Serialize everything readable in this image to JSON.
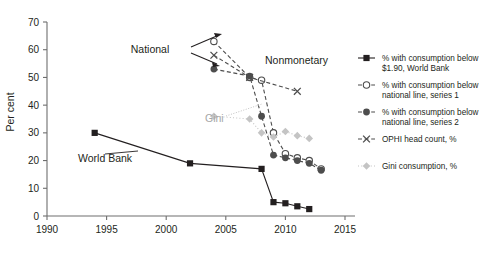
{
  "chart_data": {
    "type": "line",
    "title": "",
    "xlabel": "",
    "ylabel": "Per cent",
    "xlim": [
      1990,
      2015
    ],
    "ylim": [
      0,
      70
    ],
    "xticks": [
      1990,
      1995,
      2000,
      2005,
      2010,
      2015
    ],
    "yticks": [
      0,
      10,
      20,
      30,
      40,
      50,
      60,
      70
    ],
    "grid": false,
    "legend_position": "right",
    "series": [
      {
        "name": "% with consumption below $1.90, World Bank",
        "marker": "filled-square",
        "color": "#231f20",
        "linestyle": "solid",
        "x": [
          1994,
          2002,
          2008,
          2009,
          2010,
          2011,
          2012
        ],
        "values": [
          30,
          19,
          17,
          5,
          4.6,
          3.5,
          2.5
        ]
      },
      {
        "name": "% with consumption below national line, series 1",
        "marker": "open-circle",
        "color": "#4d4d4d",
        "linestyle": "dashed",
        "x": [
          2004,
          2007,
          2008,
          2009,
          2010,
          2011,
          2012,
          2013
        ],
        "values": [
          63,
          50,
          49,
          30,
          22.5,
          21,
          20,
          17
        ]
      },
      {
        "name": "% with consumption below national line, series 2",
        "marker": "filled-circle",
        "color": "#4d4d4d",
        "linestyle": "dashed",
        "x": [
          2004,
          2007,
          2008,
          2009,
          2010,
          2011,
          2012,
          2013
        ],
        "values": [
          53,
          50.5,
          36,
          22,
          21,
          20,
          19,
          16.5
        ]
      },
      {
        "name": "OPHI head count, %",
        "marker": "cross",
        "color": "#4d4d4d",
        "linestyle": "dashed",
        "x": [
          2004,
          2007,
          2011
        ],
        "values": [
          58,
          50,
          45
        ]
      },
      {
        "name": "Gini consumption, %",
        "marker": "diamond",
        "color": "#c4c4c4",
        "linestyle": "dotted",
        "x": [
          2004,
          2007,
          2008,
          2009,
          2010,
          2011,
          2012
        ],
        "values": [
          36,
          35,
          30,
          28.5,
          30.5,
          29,
          28
        ]
      }
    ],
    "annotations": [
      {
        "id": "national",
        "text": "National",
        "x_px": 150,
        "y_px": 50,
        "color": "#231f20"
      },
      {
        "id": "nonmonetary",
        "text": "Nonmonetary",
        "x_px": 265,
        "y_px": 62,
        "color": "#231f20"
      },
      {
        "id": "gini",
        "text": "Gini",
        "x_px": 205,
        "y_px": 118,
        "color": "#a6a6a6"
      },
      {
        "id": "world-bank",
        "text": "World Bank",
        "x_px": 78,
        "y_px": 158,
        "color": "#231f20"
      }
    ]
  },
  "legend": {
    "entries": [
      {
        "label_line1": "% with consumption below",
        "label_line2": "$1.90, World Bank",
        "marker": "filled-square",
        "color": "#231f20",
        "linestyle": "solid"
      },
      {
        "label_line1": "% with consumption below",
        "label_line2": "national line, series 1",
        "marker": "open-circle",
        "color": "#4d4d4d",
        "linestyle": "dashed"
      },
      {
        "label_line1": "% with consumption below",
        "label_line2": "national line, series 2",
        "marker": "filled-circle",
        "color": "#4d4d4d",
        "linestyle": "dashed"
      },
      {
        "label_line1": "OPHI head count, %",
        "label_line2": "",
        "marker": "cross",
        "color": "#4d4d4d",
        "linestyle": "dashed"
      },
      {
        "label_line1": "Gini consumption, %",
        "label_line2": "",
        "marker": "diamond",
        "color": "#c4c4c4",
        "linestyle": "dotted"
      }
    ]
  },
  "axis": {
    "ylabel": "Per cent",
    "ytick_labels": [
      "0",
      "10",
      "20",
      "30",
      "40",
      "50",
      "60",
      "70"
    ],
    "xtick_labels": [
      "1990",
      "1995",
      "2000",
      "2005",
      "2010",
      "2015"
    ]
  },
  "caption": {
    "text": ""
  }
}
